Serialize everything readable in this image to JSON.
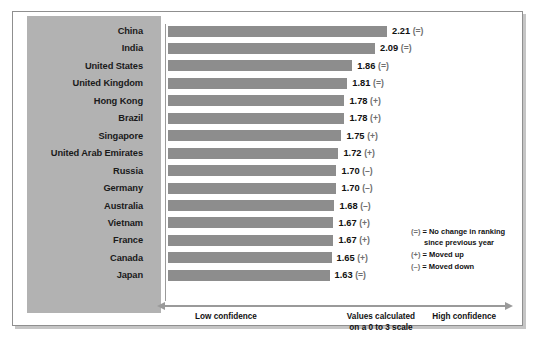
{
  "chart_data": {
    "type": "bar",
    "title": "",
    "xlabel": "Values calculated on a 0 to 3 scale",
    "ylabel": "",
    "xlim": [
      0,
      3
    ],
    "grid": false,
    "orientation": "horizontal",
    "categories": [
      "China",
      "India",
      "United States",
      "United Kingdom",
      "Hong Kong",
      "Brazil",
      "Singapore",
      "United Arab Emirates",
      "Russia",
      "Germany",
      "Australia",
      "Vietnam",
      "France",
      "Canada",
      "Japan"
    ],
    "values": [
      2.21,
      2.09,
      1.86,
      1.81,
      1.78,
      1.78,
      1.75,
      1.72,
      1.7,
      1.7,
      1.68,
      1.67,
      1.67,
      1.65,
      1.63
    ],
    "value_labels": [
      "2.21",
      "2.09",
      "1.86",
      "1.81",
      "1.78",
      "1.78",
      "1.75",
      "1.72",
      "1.70",
      "1.70",
      "1.68",
      "1.67",
      "1.67",
      "1.65",
      "1.63"
    ],
    "markers": [
      "(=)",
      "(=)",
      "(=)",
      "(=)",
      "(+)",
      "(+)",
      "(+)",
      "(+)",
      "(–)",
      "(–)",
      "(–)",
      "(+)",
      "(+)",
      "(+)",
      "(=)"
    ],
    "bar_color": "#8d8d8d",
    "panel_color": "#b2b2b2",
    "legend_position": "bottom-right"
  },
  "rows": [
    {
      "label": "China",
      "value": "2.21",
      "marker": "(=)"
    },
    {
      "label": "India",
      "value": "2.09",
      "marker": "(=)"
    },
    {
      "label": "United States",
      "value": "1.86",
      "marker": "(=)"
    },
    {
      "label": "United Kingdom",
      "value": "1.81",
      "marker": "(=)"
    },
    {
      "label": "Hong Kong",
      "value": "1.78",
      "marker": "(+)"
    },
    {
      "label": "Brazil",
      "value": "1.78",
      "marker": "(+)"
    },
    {
      "label": "Singapore",
      "value": "1.75",
      "marker": "(+)"
    },
    {
      "label": "United Arab Emirates",
      "value": "1.72",
      "marker": "(+)"
    },
    {
      "label": "Russia",
      "value": "1.70",
      "marker": "(–)"
    },
    {
      "label": "Germany",
      "value": "1.70",
      "marker": "(–)"
    },
    {
      "label": "Australia",
      "value": "1.68",
      "marker": "(–)"
    },
    {
      "label": "Vietnam",
      "value": "1.67",
      "marker": "(+)"
    },
    {
      "label": "France",
      "value": "1.67",
      "marker": "(+)"
    },
    {
      "label": "Canada",
      "value": "1.65",
      "marker": "(+)"
    },
    {
      "label": "Japan",
      "value": "1.63",
      "marker": "(=)"
    }
  ],
  "legend": {
    "equals_symbol": "(=)",
    "equals_text_line1": "= No change in ranking",
    "equals_text_line2": "since previous year",
    "plus_symbol": "(+)",
    "plus_text": "= Moved up",
    "minus_symbol": "(–)",
    "minus_text": "= Moved down"
  },
  "axis": {
    "low_label": "Low confidence",
    "mid_label_line1": "Values calculated",
    "mid_label_line2": "on a 0 to 3 scale",
    "high_label": "High confidence"
  }
}
